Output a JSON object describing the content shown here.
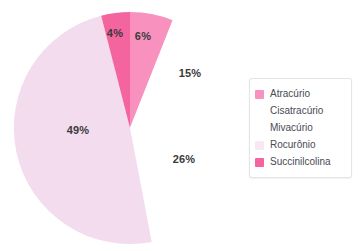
{
  "chart_data": {
    "type": "pie",
    "title": "",
    "labels": [
      "Atracúrio",
      "Cisatracúrio",
      "Mivacúrio",
      "Rocurônio",
      "Succinilcolina"
    ],
    "values": [
      6,
      15,
      26,
      49,
      4
    ],
    "value_labels": [
      "6%",
      "15%",
      "26%",
      "49%",
      "4%"
    ],
    "unit": "%",
    "start_angle_deg": 0,
    "direction": "clockwise",
    "colors": [
      "#F891BE",
      "#FFFFFF",
      "#FFFFFF",
      "#F2DCEE",
      "#F4649E"
    ],
    "legend_position": "right",
    "grid": false,
    "slices": [
      {
        "label": "Atracúrio",
        "value": 6,
        "value_label": "6%",
        "color": "#F891BE",
        "label_x": 143,
        "label_y": 36
      },
      {
        "label": "Cisatracúrio",
        "value": 15,
        "value_label": "15%",
        "color": "#FFFFFF",
        "label_x": 190,
        "label_y": 73
      },
      {
        "label": "Mivacúrio",
        "value": 26,
        "value_label": "26%",
        "color": "#FFFFFF",
        "label_x": 184,
        "label_y": 159
      },
      {
        "label": "Rocurônio",
        "value": 49,
        "value_label": "49%",
        "color": "#F2DCEE",
        "label_x": 78,
        "label_y": 130
      },
      {
        "label": "Succinilcolina",
        "value": 4,
        "value_label": "4%",
        "color": "#F4649E",
        "label_x": 115,
        "label_y": 33
      }
    ]
  },
  "legend": {
    "items": [
      {
        "label": "Atracúrio",
        "color": "#F891BE"
      },
      {
        "label": "Cisatracúrio",
        "color": "#FFFFFF"
      },
      {
        "label": "Mivacúrio",
        "color": "#FFFFFF"
      },
      {
        "label": "Rocurônio",
        "color": "#F7E8F4"
      },
      {
        "label": "Succinilcolina",
        "color": "#F4649E"
      }
    ]
  },
  "geometry": {
    "cx": 130,
    "cy": 128,
    "r": 116
  }
}
